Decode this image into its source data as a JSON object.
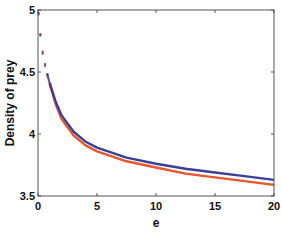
{
  "chart_data": {
    "type": "line",
    "title": "",
    "xlabel": "e",
    "ylabel": "Density of prey",
    "xlim": [
      0,
      20
    ],
    "ylim": [
      3.5,
      5
    ],
    "xticks": [
      0,
      5,
      10,
      15,
      20
    ],
    "yticks": [
      3.5,
      4,
      4.5,
      5
    ],
    "xtick_labels": [
      "0",
      "5",
      "10",
      "15",
      "20"
    ],
    "ytick_labels": [
      "3.5",
      "4",
      "4.5",
      "5"
    ],
    "grid": false,
    "legend": null,
    "series": [
      {
        "name": "blue",
        "color": "#3a3f9a",
        "x": [
          0.05,
          0.2,
          0.4,
          0.6,
          0.8,
          1,
          1.5,
          2,
          3,
          4,
          5,
          7.5,
          10,
          12.5,
          15,
          17.5,
          20
        ],
        "values": [
          4.97,
          4.8,
          4.66,
          4.56,
          4.48,
          4.41,
          4.26,
          4.15,
          4.02,
          3.94,
          3.89,
          3.81,
          3.76,
          3.72,
          3.69,
          3.66,
          3.63
        ]
      },
      {
        "name": "orange",
        "color": "#e8562a",
        "x": [
          0.05,
          0.2,
          0.4,
          0.6,
          0.8,
          1,
          1.5,
          2,
          3,
          4,
          5,
          7.5,
          10,
          12.5,
          15,
          17.5,
          20
        ],
        "values": [
          4.97,
          4.8,
          4.65,
          4.55,
          4.47,
          4.4,
          4.24,
          4.12,
          3.99,
          3.91,
          3.86,
          3.78,
          3.73,
          3.68,
          3.65,
          3.62,
          3.59
        ]
      }
    ]
  },
  "colors": {
    "axis": "#555555",
    "blue": "#3a3f9a",
    "orange": "#e8562a"
  }
}
